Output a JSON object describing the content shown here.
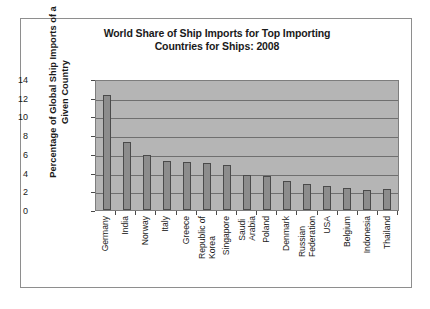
{
  "chart_data": {
    "type": "bar",
    "title": "World Share of Ship Imports for Top Importing Countries for Ships: 2008",
    "title_lines": [
      "World Share of Ship Imports for Top Importing",
      "Countries for Ships: 2008"
    ],
    "xlabel": "",
    "ylabel": "Percentage of Global Ship Imports of a Given Country",
    "ylabel_lines": [
      "Percentage of Global Ship Imports of a",
      "Given Country"
    ],
    "ylim": [
      0,
      14
    ],
    "yticks": [
      0,
      2,
      4,
      6,
      8,
      10,
      12,
      14
    ],
    "ytick_labels": [
      "0",
      "2",
      "4",
      "6",
      "8",
      "10",
      "12",
      "14"
    ],
    "grid": true,
    "legend": null,
    "categories": [
      "Germany",
      "India",
      "Norway",
      "Italy",
      "Greece",
      "Republic of Korea",
      "Singapore",
      "Saudi Arabia",
      "Poland",
      "Denmark",
      "Russian Federation",
      "USA",
      "Belgium",
      "Indonesia",
      "Thailand"
    ],
    "category_lines": [
      [
        "Germany",
        ""
      ],
      [
        "India",
        ""
      ],
      [
        "Norway",
        ""
      ],
      [
        "Italy",
        ""
      ],
      [
        "Greece",
        ""
      ],
      [
        "Republic of",
        "Korea"
      ],
      [
        "Singapore",
        ""
      ],
      [
        "Saudi",
        "Arabia"
      ],
      [
        "Poland",
        ""
      ],
      [
        "Denmark",
        ""
      ],
      [
        "Russian",
        "Federation"
      ],
      [
        "USA",
        ""
      ],
      [
        "Belgium",
        ""
      ],
      [
        "Indonesia",
        ""
      ],
      [
        "Thailand",
        ""
      ]
    ],
    "values": [
      12.3,
      7.3,
      5.85,
      5.2,
      5.15,
      5.05,
      4.85,
      3.75,
      3.6,
      3.05,
      2.8,
      2.6,
      2.4,
      2.1,
      2.2
    ],
    "colors": {
      "bar_fill": "#8c8c8c",
      "bar_edge": "#4a4a4a",
      "plot_background": "#b5b5b5",
      "gridline": "#6f6f6f",
      "figure_border": "#8e8e8e",
      "text": "#1a1a1a"
    }
  }
}
